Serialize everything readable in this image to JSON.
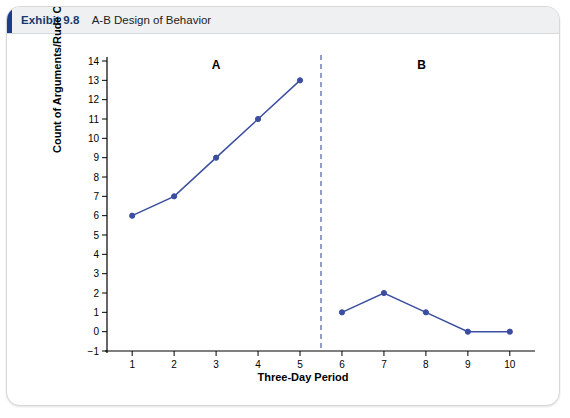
{
  "header": {
    "exhibit_label": "Exhibit 9.8",
    "title": "A-B Design of Behavior"
  },
  "chart_data": {
    "type": "line",
    "title": "A-B Design of Behavior",
    "xlabel": "Three-Day Period",
    "ylabel": "Count of Arguments/Rude Comments",
    "x": [
      1,
      2,
      3,
      4,
      5,
      6,
      7,
      8,
      9,
      10
    ],
    "xlim": [
      0.4,
      10.6
    ],
    "ylim": [
      -1,
      14
    ],
    "yticks": [
      -1,
      0,
      1,
      2,
      3,
      4,
      5,
      6,
      7,
      8,
      9,
      10,
      11,
      12,
      13,
      14
    ],
    "xticks": [
      1,
      2,
      3,
      4,
      5,
      6,
      7,
      8,
      9,
      10
    ],
    "grid": false,
    "legend": "none",
    "line_color": "#3b4ea0",
    "marker_color": "#3b4ea0",
    "series": [
      {
        "name": "Phase A (baseline)",
        "x": [
          1,
          2,
          3,
          4,
          5
        ],
        "values": [
          6,
          7,
          9,
          11,
          13
        ]
      },
      {
        "name": "Phase B (intervention)",
        "x": [
          6,
          7,
          8,
          9,
          10
        ],
        "values": [
          1,
          2,
          1,
          0,
          0
        ]
      }
    ],
    "annotations": [
      {
        "name": "phase-a-label",
        "text": "A",
        "x": 3,
        "y": 13.6
      },
      {
        "name": "phase-b-label",
        "text": "B",
        "x": 7.9,
        "y": 13.6
      }
    ],
    "phase_divider": {
      "x": 5.5,
      "style": "dashed",
      "color": "#3b4ea0"
    }
  }
}
